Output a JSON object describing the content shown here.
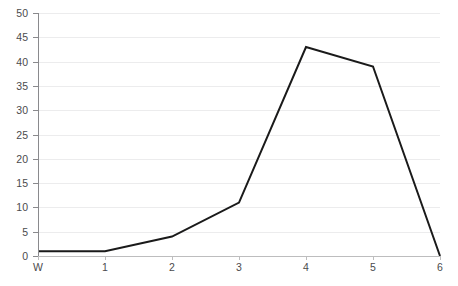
{
  "chart_data": {
    "type": "line",
    "title": "",
    "subtitle": "",
    "xlabel": "",
    "ylabel": "",
    "categories": [
      "W",
      "1",
      "2",
      "3",
      "4",
      "5",
      "6"
    ],
    "x_tick_labels": [
      "W",
      "1",
      "2",
      "3",
      "4",
      "5",
      "6"
    ],
    "y_tick_labels": [
      "0",
      "5",
      "10",
      "15",
      "20",
      "25",
      "30",
      "35",
      "40",
      "45",
      "50"
    ],
    "y_ticks": [
      0,
      5,
      10,
      15,
      20,
      25,
      30,
      35,
      40,
      45,
      50
    ],
    "ylim": [
      0,
      50
    ],
    "xlim": [
      0,
      6
    ],
    "grid": "horizontal",
    "legend": "none",
    "annotations": [],
    "series": [
      {
        "name": "series-1",
        "color": "#1a1a1a",
        "line_width": 2,
        "markers": "none",
        "values": [
          1,
          1,
          4,
          11,
          43,
          39,
          0
        ]
      }
    ]
  },
  "colors": {
    "series_line": "#1a1a1a",
    "gridline": "#ececed",
    "baseline": "#d9d9da",
    "y_axis_spine": "#8a8a8d",
    "x_axis_spine": "#bdbdbe",
    "tick_label": "#4b4b4d",
    "background": "#ffffff"
  }
}
